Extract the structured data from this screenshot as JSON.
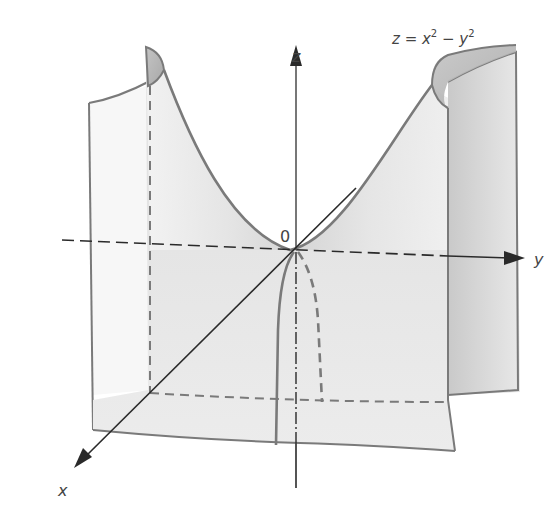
{
  "figure": {
    "type": "hyperbolic-paraboloid",
    "equation": {
      "lhs": "z = x",
      "exp1": "2",
      "minus": " − y",
      "exp2": "2",
      "full": "z = x² − y²"
    },
    "axes": {
      "x_label": "x",
      "y_label": "y",
      "z_label": "z",
      "origin_label": "0"
    },
    "colors": {
      "surface_light": "#f2f2f2",
      "surface_shade": "#c8c8c8",
      "edge": "#7a7a7a",
      "axis": "#2a2a2a",
      "text": "#444444"
    }
  }
}
